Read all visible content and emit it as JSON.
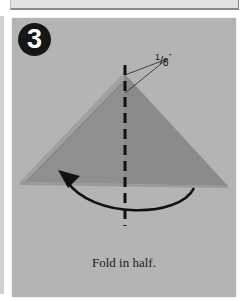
{
  "step": {
    "number": "3",
    "caption": "Fold in half.",
    "measurement": {
      "numerator": "1",
      "slash": "/",
      "denominator": "8",
      "unit": "\""
    }
  },
  "colors": {
    "panel_background": "#b4b4b4",
    "paper_left": "#8f8f8f",
    "paper_right": "#8c8c8c",
    "paper_edge": "#9c9c9c",
    "badge": "#161616",
    "lines": "#111111"
  },
  "icons": {
    "fold_line": "dashed-vertical-line",
    "fold_arrow": "curved-arrow-left"
  }
}
